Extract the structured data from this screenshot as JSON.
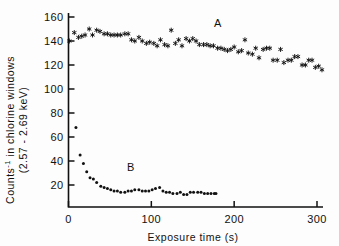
{
  "figure": {
    "background_color": "#fdfdfd",
    "ink_color": "#111111"
  },
  "axes": {
    "x_title": "Exposure time (s)",
    "y_title_line1": "Counts",
    "y_title_sup": "-1",
    "y_title_line1_rest": " in chlorine windows",
    "y_title_line2": "(2.57 - 2.69 keV)",
    "x_ticks": [
      0,
      100,
      200,
      300
    ],
    "x_tick_labels": [
      "0",
      "100",
      "200",
      "300"
    ],
    "y_ticks": [
      20,
      40,
      60,
      80,
      100,
      120,
      140,
      160
    ],
    "y_tick_labels": [
      "20",
      "40",
      "60",
      "80",
      "100",
      "120",
      "140",
      "160"
    ],
    "xlim": [
      0,
      310
    ],
    "ylim": [
      0,
      168
    ],
    "grid": false
  },
  "annotations": [
    {
      "text": "A",
      "x": 180,
      "y": 152
    },
    {
      "text": "B",
      "x": 75,
      "y": 32
    }
  ],
  "chart_data": {
    "type": "scatter",
    "title": "",
    "xlabel": "Exposure time (s)",
    "ylabel": "Counts-1 in chlorine windows (2.57 - 2.69 keV)",
    "xlim": [
      0,
      310
    ],
    "ylim": [
      0,
      168
    ],
    "grid": false,
    "legend_position": "inline-annotation",
    "series": [
      {
        "name": "A",
        "marker": "star",
        "color": "#111111",
        "label_position": {
          "x": 180,
          "y": 152
        },
        "points": [
          [
            1,
            140
          ],
          [
            7,
            147
          ],
          [
            12,
            143
          ],
          [
            16,
            144
          ],
          [
            20,
            145
          ],
          [
            25,
            150
          ],
          [
            29,
            145
          ],
          [
            34,
            149
          ],
          [
            38,
            148
          ],
          [
            43,
            146
          ],
          [
            47,
            146
          ],
          [
            51,
            145
          ],
          [
            55,
            145
          ],
          [
            59,
            145
          ],
          [
            63,
            145
          ],
          [
            68,
            146
          ],
          [
            72,
            146
          ],
          [
            76,
            141
          ],
          [
            80,
            140
          ],
          [
            85,
            143
          ],
          [
            89,
            140
          ],
          [
            94,
            138
          ],
          [
            98,
            139
          ],
          [
            103,
            138
          ],
          [
            107,
            136
          ],
          [
            111,
            141
          ],
          [
            116,
            137
          ],
          [
            120,
            136
          ],
          [
            124,
            149
          ],
          [
            129,
            138
          ],
          [
            133,
            141
          ],
          [
            137,
            136
          ],
          [
            142,
            142
          ],
          [
            146,
            140
          ],
          [
            150,
            142
          ],
          [
            154,
            140
          ],
          [
            158,
            137
          ],
          [
            163,
            137
          ],
          [
            167,
            137
          ],
          [
            171,
            136
          ],
          [
            175,
            136
          ],
          [
            180,
            134
          ],
          [
            184,
            134
          ],
          [
            188,
            133
          ],
          [
            192,
            132
          ],
          [
            196,
            133
          ],
          [
            200,
            135
          ],
          [
            205,
            131
          ],
          [
            209,
            132
          ],
          [
            213,
            141
          ],
          [
            217,
            130
          ],
          [
            222,
            129
          ],
          [
            226,
            134
          ],
          [
            230,
            126
          ],
          [
            235,
            133
          ],
          [
            239,
            134
          ],
          [
            243,
            134
          ],
          [
            247,
            124
          ],
          [
            252,
            124
          ],
          [
            256,
            133
          ],
          [
            260,
            122
          ],
          [
            265,
            124
          ],
          [
            269,
            124
          ],
          [
            273,
            127
          ],
          [
            277,
            127
          ],
          [
            282,
            120
          ],
          [
            286,
            120
          ],
          [
            290,
            124
          ],
          [
            294,
            124
          ],
          [
            298,
            118
          ],
          [
            302,
            119
          ],
          [
            306,
            116
          ]
        ]
      },
      {
        "name": "B",
        "marker": "dot",
        "color": "#111111",
        "label_position": {
          "x": 75,
          "y": 32
        },
        "points": [
          [
            9,
            68
          ],
          [
            14,
            45
          ],
          [
            18,
            38
          ],
          [
            22,
            31
          ],
          [
            26,
            26
          ],
          [
            30,
            25
          ],
          [
            34,
            22
          ],
          [
            39,
            19
          ],
          [
            43,
            18
          ],
          [
            47,
            17
          ],
          [
            51,
            16
          ],
          [
            55,
            15
          ],
          [
            59,
            15
          ],
          [
            63,
            14
          ],
          [
            68,
            14
          ],
          [
            72,
            15
          ],
          [
            76,
            15
          ],
          [
            80,
            16
          ],
          [
            85,
            16
          ],
          [
            89,
            15
          ],
          [
            93,
            15
          ],
          [
            97,
            15
          ],
          [
            101,
            16
          ],
          [
            105,
            17
          ],
          [
            110,
            18
          ],
          [
            114,
            15
          ],
          [
            118,
            14
          ],
          [
            122,
            14
          ],
          [
            126,
            13
          ],
          [
            131,
            13
          ],
          [
            135,
            14
          ],
          [
            139,
            12
          ],
          [
            143,
            12
          ],
          [
            147,
            14
          ],
          [
            151,
            14
          ],
          [
            156,
            14
          ],
          [
            160,
            14
          ],
          [
            164,
            13
          ],
          [
            168,
            13
          ],
          [
            172,
            13
          ],
          [
            176,
            13
          ],
          [
            178,
            13
          ]
        ]
      }
    ]
  }
}
